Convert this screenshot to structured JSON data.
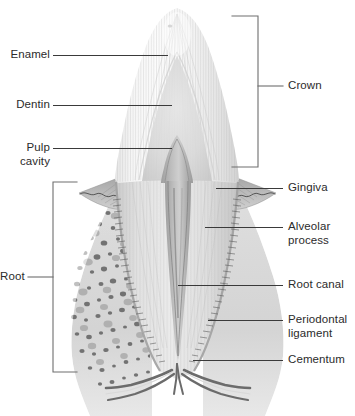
{
  "figure": {
    "background_color": "#ffffff",
    "text_color": "#2b2b2b",
    "leader_line_color": "#3a3a3a",
    "bracket_color": "#6e6e6e",
    "width": 355,
    "height": 416
  },
  "labels": {
    "enamel": "Enamel",
    "dentin": "Dentin",
    "pulp_cavity": "Pulp\ncavity",
    "crown": "Crown",
    "gingiva": "Gingiva",
    "alveolar_process": "Alveolar\nprocess",
    "root_canal": "Root canal",
    "periodontal_ligament": "Periodontal\nligament",
    "cementum": "Cementum",
    "root": "Root"
  },
  "structures": {
    "enamel": {
      "name": "enamel",
      "tone": "#f2f2f2"
    },
    "dentin": {
      "name": "dentin",
      "tone": "#dcdcdc"
    },
    "pulp_cavity": {
      "name": "pulp-cavity",
      "tone": "#bdbdbd"
    },
    "root_canal": {
      "name": "root-canal",
      "tone": "#a9a9a9"
    },
    "gingiva": {
      "name": "gingiva",
      "tone": "#b4b4b4"
    },
    "alveolar_bone": {
      "name": "alveolar-bone",
      "tone": "#cfcfcf"
    },
    "periodontal_ligament": {
      "name": "periodontal-ligament",
      "tone": "#8f8f8f"
    },
    "cementum": {
      "name": "cementum",
      "tone": "#c6c6c6"
    },
    "neurovascular_bundle": {
      "name": "nerve-and-vessels",
      "tone": "#8a8a8a"
    }
  }
}
